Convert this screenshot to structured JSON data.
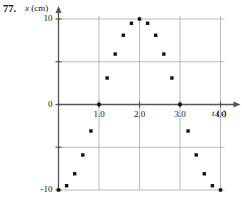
{
  "problem": {
    "number": "77."
  },
  "axes": {
    "y_title_var": "x",
    "y_title_unit": "(cm)",
    "x_title_var": "t",
    "x_title_unit": "(s)",
    "y_ticks": [
      "10",
      "0",
      "-10"
    ],
    "x_ticks": [
      "1.0",
      "2.0",
      "3.0",
      "4.0"
    ]
  },
  "colors": {
    "axis": "#555555",
    "grid": "#b9b9b9",
    "point": "#111111",
    "text": "#111111",
    "background": "#ffffff"
  },
  "chart_data": {
    "type": "scatter",
    "title": "",
    "xlabel": "t (s)",
    "ylabel": "x (cm)",
    "xlim": [
      0,
      4.15
    ],
    "ylim": [
      -10,
      10
    ],
    "xticks": [
      1.0,
      2.0,
      3.0,
      4.0
    ],
    "yticks": [
      -10,
      -5,
      0,
      5,
      10
    ],
    "grid": true,
    "legend": null,
    "series": [
      {
        "name": "x(t)",
        "x": [
          0.0,
          0.2,
          0.4,
          0.6,
          0.8,
          1.0,
          1.2,
          1.4,
          1.6,
          1.8,
          2.0,
          2.2,
          2.4,
          2.6,
          2.8,
          3.0,
          3.2,
          3.4,
          3.6,
          3.8,
          4.0
        ],
        "y": [
          -10.0,
          -9.5,
          -8.1,
          -5.9,
          -3.1,
          0.0,
          3.1,
          5.9,
          8.1,
          9.5,
          10.0,
          9.5,
          8.1,
          5.9,
          3.1,
          0.0,
          -3.1,
          -5.9,
          -8.1,
          -9.5,
          -10.0
        ]
      }
    ]
  }
}
